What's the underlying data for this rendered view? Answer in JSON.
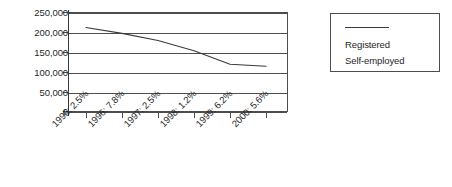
{
  "chart_data": {
    "type": "line",
    "title": "",
    "xlabel": "",
    "ylabel": "",
    "categories": [
      "1995: 2.5%",
      "1996: 7.8%",
      "1997: 2.5%",
      "1998: 1.2%",
      "1999: 6.2%",
      "2000: 5.6%"
    ],
    "series": [
      {
        "name": "Registered",
        "values": [
          211000,
          196000,
          178000,
          152000,
          118000,
          113000
        ]
      }
    ],
    "legend_entries": [
      "Registered",
      "Self-employed"
    ],
    "legend_position": "right",
    "grid": true,
    "ylim": [
      0,
      250000
    ],
    "ytick_labels": [
      "250,000",
      "200,000",
      "150,000",
      "100,000",
      "50,000",
      "0"
    ],
    "ytick_values": [
      250000,
      200000,
      150000,
      100000,
      50000,
      0
    ],
    "line_color": "#3a3a3a",
    "axis_color": "#4d4d4d",
    "background_color": "#ffffff"
  },
  "legend": {
    "registered": "Registered",
    "self_employed": "Self-employed"
  }
}
